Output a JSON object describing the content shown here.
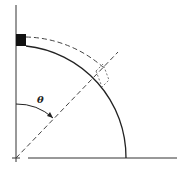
{
  "diagram": {
    "type": "quarter-circle geometry",
    "angle_label": "θ",
    "colors": {
      "line": "#222222",
      "dashed": "#444444",
      "block": "#111111",
      "background": "#ffffff"
    },
    "elements": [
      "vertical axis",
      "horizontal axis",
      "solid quarter arc",
      "dashed outer arc",
      "black block at top of arc",
      "dashed radial line at angle theta",
      "dashed small rectangle at arc intersection",
      "angle arc arrow labeled theta"
    ]
  }
}
